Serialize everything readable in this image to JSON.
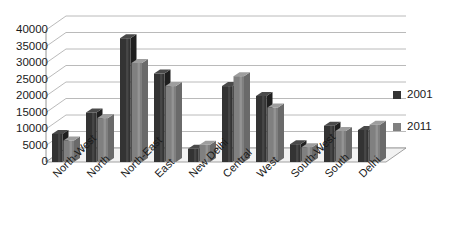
{
  "chart_data": {
    "type": "bar",
    "title": "",
    "subtitle": "",
    "xlabel": "",
    "ylabel": "",
    "ylim": [
      0,
      40000
    ],
    "ytick_step": 5000,
    "yticks": [
      "0",
      "5000",
      "10000",
      "15000",
      "20000",
      "25000",
      "30000",
      "35000",
      "40000"
    ],
    "grid": true,
    "grid_axis": "y",
    "legend_position": "right",
    "style": "3d-perspective",
    "categories": [
      "North-West",
      "North",
      "North-East",
      "East",
      "New Delhi",
      "Central",
      "West",
      "South-West",
      "South",
      "Delhi"
    ],
    "series": [
      {
        "name": "2001",
        "color": "#333333",
        "values": [
          8500,
          15000,
          37500,
          26800,
          4000,
          23000,
          20000,
          5400,
          11000,
          9700
        ]
      },
      {
        "name": "2011",
        "color": "#808080",
        "values": [
          6500,
          13300,
          30000,
          23000,
          5200,
          26000,
          16500,
          4500,
          9400,
          11300
        ]
      }
    ]
  },
  "legend": {
    "items": [
      {
        "label": "2001",
        "color": "#333333"
      },
      {
        "label": "2011",
        "color": "#808080"
      }
    ]
  },
  "colors": {
    "series_2001": "#333333",
    "series_2011": "#808080",
    "gridline": "#a8a8a8",
    "axis": "#8a8a8a",
    "text": "#1a1a1a",
    "background": "#ffffff",
    "floor": "#f2f2f2"
  }
}
